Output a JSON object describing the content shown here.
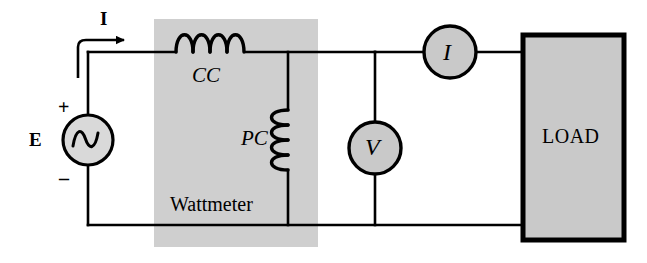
{
  "figure": {
    "type": "circuit-diagram",
    "background_color": "#ffffff",
    "line_color": "#000000"
  },
  "source": {
    "label": "E",
    "plus_sign": "+",
    "minus_sign": "–",
    "symbol": "ac-sine-source",
    "fill_color": "#d4d4d4"
  },
  "current_arrow": {
    "label": "I",
    "direction": "right"
  },
  "wattmeter": {
    "label": "Wattmeter",
    "box_fill": "#cfcfcf",
    "current_coil": {
      "label": "CC",
      "name": "current-coil",
      "orientation": "horizontal",
      "turns": 4
    },
    "potential_coil": {
      "label": "PC",
      "name": "potential-coil",
      "orientation": "vertical",
      "turns": 4
    }
  },
  "meters": [
    {
      "label": "I",
      "name": "ammeter",
      "connection": "series",
      "fill_color": "#c9c9c9"
    },
    {
      "label": "V",
      "name": "voltmeter",
      "connection": "shunt",
      "fill_color": "#c9c9c9"
    }
  ],
  "load": {
    "label": "LOAD",
    "fill_color": "#c9c9c9",
    "border_color": "#000000"
  }
}
